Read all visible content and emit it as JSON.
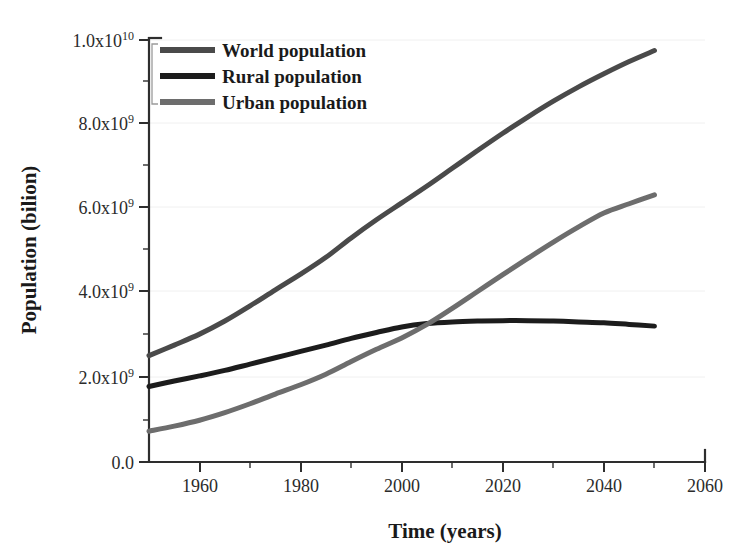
{
  "chart_data": {
    "type": "line",
    "title": "",
    "xlabel": "Time (years)",
    "ylabel": "Population (bilion)",
    "xlim": [
      1950,
      2060
    ],
    "ylim": [
      0,
      10000000000
    ],
    "grid": true,
    "legend_position": "top-left",
    "x_tick_labels": [
      "1960",
      "1980",
      "2000",
      "2020",
      "2040",
      "2060"
    ],
    "x_ticks": [
      1960,
      1980,
      2000,
      2020,
      2040,
      2060
    ],
    "x_minor_ticks": [
      1970,
      1990,
      2010,
      2030,
      2050
    ],
    "y_tick_labels": [
      "0.0",
      "2.0x10",
      "4.0x10",
      "6.0x10",
      "8.0x10",
      "1.0x10"
    ],
    "y_tick_exponents": [
      "",
      "9",
      "9",
      "9",
      "9",
      "10"
    ],
    "y_ticks": [
      0,
      2000000000,
      4000000000,
      6000000000,
      8000000000,
      10000000000
    ],
    "x": [
      1950,
      1955,
      1960,
      1965,
      1970,
      1975,
      1980,
      1985,
      1990,
      1995,
      2000,
      2005,
      2010,
      2015,
      2020,
      2025,
      2030,
      2035,
      2040,
      2045,
      2050
    ],
    "series": [
      {
        "name": "World population",
        "color": "#4a4a4a",
        "values": [
          2.52,
          2.77,
          3.03,
          3.34,
          3.7,
          4.08,
          4.45,
          4.85,
          5.31,
          5.74,
          6.14,
          6.54,
          6.96,
          7.38,
          7.79,
          8.18,
          8.55,
          8.89,
          9.2,
          9.49,
          9.75
        ]
      },
      {
        "name": "Rural population",
        "color": "#1c1c1c",
        "values": [
          1.79,
          1.92,
          2.04,
          2.17,
          2.32,
          2.47,
          2.62,
          2.77,
          2.93,
          3.07,
          3.2,
          3.28,
          3.32,
          3.34,
          3.35,
          3.35,
          3.34,
          3.32,
          3.3,
          3.26,
          3.22
        ]
      },
      {
        "name": "Urban population",
        "color": "#6d6d6d",
        "values": [
          0.73,
          0.85,
          0.99,
          1.17,
          1.38,
          1.61,
          1.83,
          2.08,
          2.38,
          2.67,
          2.94,
          3.26,
          3.64,
          4.04,
          4.44,
          4.83,
          5.21,
          5.57,
          5.9,
          6.12,
          6.33
        ]
      }
    ],
    "value_unit": "billions",
    "legend_entries": [
      "World population",
      "Rural population",
      "Urban population"
    ]
  },
  "colors": {
    "world": "#4a4a4a",
    "rural": "#1c1c1c",
    "urban": "#6d6d6d",
    "axis": "#2e2e2e",
    "grid": "#f0f0f0",
    "background": "#ffffff"
  }
}
